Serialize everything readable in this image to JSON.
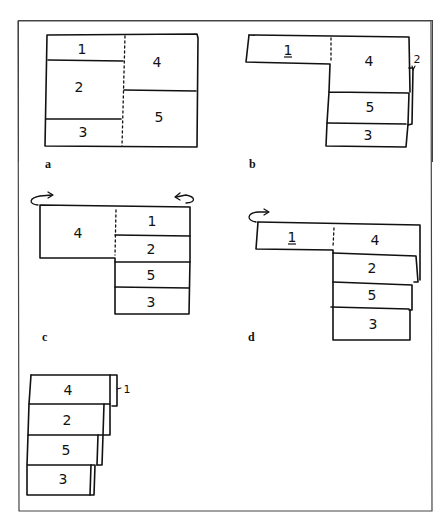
{
  "figure": {
    "panels": [
      {
        "id": "a",
        "label": "a",
        "description": "Unfolded sheet with sections 1, 2, 3 on left and 4, 5 on right, divided by dotted fold line"
      },
      {
        "id": "b",
        "label": "b",
        "description": "Section 2 folded behind 4; sections 5, 3 below",
        "annotation": "2"
      },
      {
        "id": "c",
        "label": "c",
        "description": "Sheet flipped with rotation arrows; 4 beside 1, 2, 5, 3 stacked"
      },
      {
        "id": "d",
        "label": "d",
        "description": "Section 1 folded with rotation arrow; 1 beside 4, 2, 5, 3 stacked"
      },
      {
        "id": "e",
        "label": "",
        "description": "Final folded stack 4, 2, 5, 3 with 1 tucked behind",
        "annotation": "1"
      }
    ],
    "sections": {
      "a": [
        "1",
        "2",
        "3",
        "4",
        "5"
      ],
      "b": [
        "1",
        "4",
        "5",
        "3"
      ],
      "c": [
        "4",
        "1",
        "2",
        "5",
        "3"
      ],
      "d": [
        "1",
        "4",
        "2",
        "5",
        "3"
      ],
      "e": [
        "4",
        "2",
        "5",
        "3"
      ]
    }
  }
}
